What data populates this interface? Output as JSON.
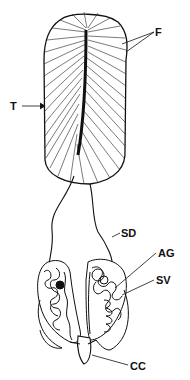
{
  "diagram": {
    "labels": [
      {
        "id": "F",
        "text": "F"
      },
      {
        "id": "T",
        "text": "T"
      },
      {
        "id": "SD",
        "text": "SD"
      },
      {
        "id": "AG",
        "text": "AG"
      },
      {
        "id": "SV",
        "text": "SV"
      },
      {
        "id": "CC",
        "text": "CC"
      }
    ]
  },
  "colors": {
    "ink": "#111111",
    "background": "#ffffff"
  }
}
